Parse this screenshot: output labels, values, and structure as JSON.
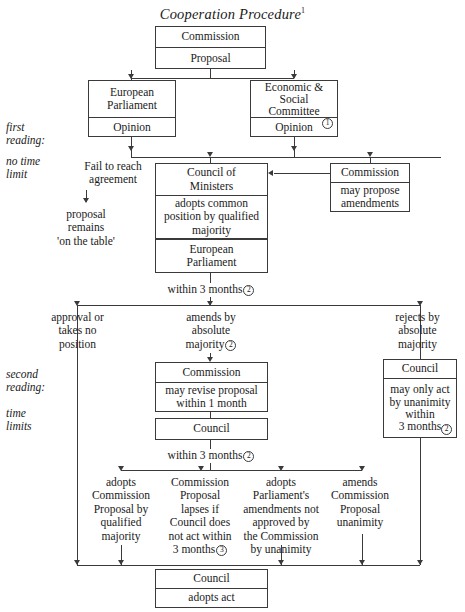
{
  "title": {
    "text": "Cooperation Procedure",
    "footnote": "1"
  },
  "margin_labels": {
    "first_reading": "first\nreading:",
    "no_time_limit": "no time\nlimit",
    "second_reading": "second\nreading:",
    "time_limits": "time\nlimits"
  },
  "boxes": {
    "commission_proposal": {
      "header": "Commission",
      "body": "Proposal"
    },
    "european_parliament_opinion": {
      "header": "European\nParliament",
      "body": "Opinion"
    },
    "economic_social_committee": {
      "header": "Economic &\nSocial\nCommittee",
      "header_note": "1",
      "body": "Opinion"
    },
    "council_of_ministers": {
      "header": "Council of\nMinisters",
      "body": "adopts common\nposition by qualified\nmajority"
    },
    "commission_amendments": {
      "header": "Commission",
      "body": "may propose\namendments"
    },
    "european_parliament_2": {
      "header": "European\nParliament"
    },
    "commission_revise": {
      "header": "Commission",
      "body": "may revise proposal\nwithin 1 month"
    },
    "council_mid": {
      "header": "Council"
    },
    "council_unanimity": {
      "header": "Council",
      "body": "may only act\nby unanimity\nwithin\n3 months",
      "body_note": "2"
    },
    "council_adopts_act": {
      "header": "Council",
      "body": "adopts act"
    }
  },
  "labels": {
    "fail_to_reach": "Fail to reach\nagreement",
    "proposal_remains": "proposal\nremains\n'on the table'",
    "within_3_months_1": "within 3 months",
    "within_3_months_1_note": "2",
    "approval_or": "approval or\ntakes no\nposition",
    "amends_by": "amends by\nabsolute\nmajority",
    "amends_by_note": "2",
    "rejects_by": "rejects by\nabsolute\nmajority",
    "within_3_months_2": "within 3 months",
    "within_3_months_2_note": "2",
    "outcome_1": "adopts\nCommission\nProposal by\nqualified\nmajority",
    "outcome_2": "Commission\nProposal\nlapses if\nCouncil does\nnot act within\n3 months",
    "outcome_2_note": "3",
    "outcome_3": "adopts\nParliament's\namendments not\napproved by\nthe Commission\nby unanimity",
    "outcome_4": "amends\nCommission\nProposal\nunanimity"
  },
  "colors": {
    "line": "#3a3a3a",
    "text": "#1a1a1a",
    "background": "#ffffff"
  }
}
